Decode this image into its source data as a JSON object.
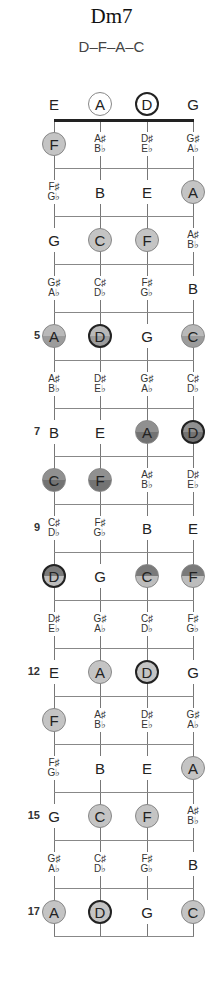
{
  "chord": {
    "name": "Dm7",
    "notes": "D–F–A–C"
  },
  "layout": {
    "string_x": [
      54,
      100,
      147,
      193
    ],
    "nut_y": 120,
    "fret_spacing": 48,
    "open_y": 104,
    "frets": 17
  },
  "open_strings": [
    {
      "note": "E",
      "marked": false,
      "root": false
    },
    {
      "note": "A",
      "marked": true,
      "root": false
    },
    {
      "note": "D",
      "marked": true,
      "root": true
    },
    {
      "note": "G",
      "marked": false,
      "root": false
    }
  ],
  "fret_numbers": {
    "5": "5",
    "7": "7",
    "9": "9",
    "12": "12",
    "15": "15",
    "17": "17"
  },
  "frets": [
    {
      "fret": 1,
      "style": "c-light",
      "cells": [
        {
          "n": "F",
          "m": true
        },
        {
          "n": "A♯/B♭"
        },
        {
          "n": "D♯/E♭"
        },
        {
          "n": "G♯/A♭"
        }
      ]
    },
    {
      "fret": 2,
      "style": "c-light",
      "cells": [
        {
          "n": "F♯/G♭"
        },
        {
          "n": "B"
        },
        {
          "n": "E"
        },
        {
          "n": "A",
          "m": true
        }
      ]
    },
    {
      "fret": 3,
      "style": "c-light",
      "cells": [
        {
          "n": "G"
        },
        {
          "n": "C",
          "m": true
        },
        {
          "n": "F",
          "m": true
        },
        {
          "n": "A♯/B♭"
        }
      ]
    },
    {
      "fret": 4,
      "style": "c-light",
      "cells": [
        {
          "n": "G♯/A♭"
        },
        {
          "n": "C♯/D♭"
        },
        {
          "n": "F♯/G♭"
        },
        {
          "n": "B"
        }
      ]
    },
    {
      "fret": 5,
      "style": "c-mid",
      "cells": [
        {
          "n": "A",
          "m": true
        },
        {
          "n": "D",
          "m": true,
          "r": true
        },
        {
          "n": "G"
        },
        {
          "n": "C",
          "m": true
        }
      ]
    },
    {
      "fret": 6,
      "style": "c-mid",
      "cells": [
        {
          "n": "A♯/B♭"
        },
        {
          "n": "D♯/E♭"
        },
        {
          "n": "G♯/A♭"
        },
        {
          "n": "C♯/D♭"
        }
      ]
    },
    {
      "fret": 7,
      "style": "c-dark",
      "cells": [
        {
          "n": "B"
        },
        {
          "n": "E"
        },
        {
          "n": "A",
          "m": true
        },
        {
          "n": "D",
          "m": true,
          "r": true
        }
      ]
    },
    {
      "fret": 8,
      "style": "c-dark",
      "cells": [
        {
          "n": "C",
          "m": true
        },
        {
          "n": "F",
          "m": true
        },
        {
          "n": "A♯/B♭"
        },
        {
          "n": "D♯/E♭"
        }
      ]
    },
    {
      "fret": 9,
      "style": "c-dark",
      "cells": [
        {
          "n": "C♯/D♭"
        },
        {
          "n": "F♯/G♭"
        },
        {
          "n": "B"
        },
        {
          "n": "E"
        }
      ]
    },
    {
      "fret": 10,
      "style": "c-inv",
      "cells": [
        {
          "n": "D",
          "m": true,
          "r": true
        },
        {
          "n": "G"
        },
        {
          "n": "C",
          "m": true
        },
        {
          "n": "F",
          "m": true
        }
      ]
    },
    {
      "fret": 11,
      "style": "c-light",
      "cells": [
        {
          "n": "D♯/E♭"
        },
        {
          "n": "G♯/A♭"
        },
        {
          "n": "C♯/D♭"
        },
        {
          "n": "F♯/G♭"
        }
      ]
    },
    {
      "fret": 12,
      "style": "c-light",
      "cells": [
        {
          "n": "E"
        },
        {
          "n": "A",
          "m": true
        },
        {
          "n": "D",
          "m": true,
          "r": true
        },
        {
          "n": "G"
        }
      ]
    },
    {
      "fret": 13,
      "style": "c-light",
      "cells": [
        {
          "n": "F",
          "m": true
        },
        {
          "n": "A♯/B♭"
        },
        {
          "n": "D♯/E♭"
        },
        {
          "n": "G♯/A♭"
        }
      ]
    },
    {
      "fret": 14,
      "style": "c-light",
      "cells": [
        {
          "n": "F♯/G♭"
        },
        {
          "n": "B"
        },
        {
          "n": "E"
        },
        {
          "n": "A",
          "m": true
        }
      ]
    },
    {
      "fret": 15,
      "style": "c-light",
      "cells": [
        {
          "n": "G"
        },
        {
          "n": "C",
          "m": true
        },
        {
          "n": "F",
          "m": true
        },
        {
          "n": "A♯/B♭"
        }
      ]
    },
    {
      "fret": 16,
      "style": "c-light",
      "cells": [
        {
          "n": "G♯/A♭"
        },
        {
          "n": "C♯/D♭"
        },
        {
          "n": "F♯/G♭"
        },
        {
          "n": "B"
        }
      ]
    },
    {
      "fret": 17,
      "style": "c-light",
      "cells": [
        {
          "n": "A",
          "m": true
        },
        {
          "n": "D",
          "m": true,
          "r": true
        },
        {
          "n": "G"
        },
        {
          "n": "C",
          "m": true
        }
      ]
    }
  ]
}
